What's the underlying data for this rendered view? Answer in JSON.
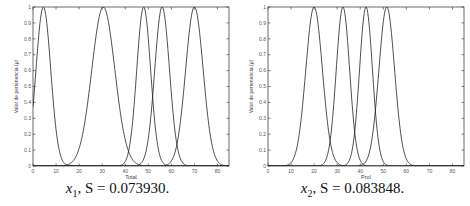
{
  "chart_data": [
    {
      "type": "line",
      "title": "",
      "caption": {
        "var": "x",
        "sub": "1",
        "text": ", S = 0.073930."
      },
      "xlabel": "Total",
      "ylabel": "Valor de pertenencia (μ)",
      "xlim": [
        0,
        85
      ],
      "ylim": [
        0,
        1
      ],
      "xticks": [
        0,
        10,
        20,
        30,
        40,
        50,
        60,
        70,
        80
      ],
      "yticks": [
        0,
        0.1,
        0.2,
        0.3,
        0.4,
        0.5,
        0.6,
        0.7,
        0.8,
        0.9,
        1
      ],
      "grid": false,
      "series": [
        {
          "name": "MF1",
          "center": 4.5,
          "width": 3.2
        },
        {
          "name": "MF2",
          "center": 30.5,
          "width": 5.0
        },
        {
          "name": "MF3",
          "center": 48,
          "width": 3.0
        },
        {
          "name": "MF4",
          "center": 56,
          "width": 3.2
        },
        {
          "name": "MF5",
          "center": 70,
          "width": 3.8
        }
      ]
    },
    {
      "type": "line",
      "title": "",
      "caption": {
        "var": "x",
        "sub": "2",
        "text": ", S = 0.083848."
      },
      "xlabel": "Prol",
      "ylabel": "Valor de pertenencia (μ)",
      "xlim": [
        0,
        85
      ],
      "ylim": [
        0,
        1
      ],
      "xticks": [
        0,
        10,
        20,
        30,
        40,
        50,
        60,
        70,
        80
      ],
      "yticks": [
        0,
        0.1,
        0.2,
        0.3,
        0.4,
        0.5,
        0.6,
        0.7,
        0.8,
        0.9,
        1
      ],
      "grid": false,
      "series": [
        {
          "name": "MF1",
          "center": 20,
          "width": 3.6
        },
        {
          "name": "MF2",
          "center": 32.5,
          "width": 2.9
        },
        {
          "name": "MF3",
          "center": 42.5,
          "width": 2.8
        },
        {
          "name": "MF4",
          "center": 51.5,
          "width": 3.4
        }
      ]
    }
  ]
}
